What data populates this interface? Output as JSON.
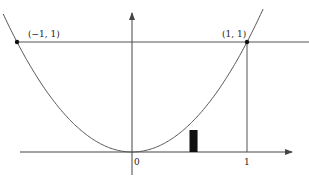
{
  "figure": {
    "function": "y = x^2",
    "points": [
      {
        "label": "(−1, 1)",
        "x": -1,
        "y": 1
      },
      {
        "label": "(1, 1)",
        "x": 1,
        "y": 1
      }
    ],
    "x_ticks": [
      {
        "label": "0",
        "value": 0
      },
      {
        "label": "1",
        "value": 1
      }
    ],
    "horizontal_line_y": 1,
    "vertical_line_x": 1,
    "rectangle": {
      "x_start": 0.5,
      "x_end": 0.57,
      "height": 0.2
    },
    "colors": {
      "curve": "#555555",
      "axes": "#444444",
      "fill": "#111111"
    }
  }
}
